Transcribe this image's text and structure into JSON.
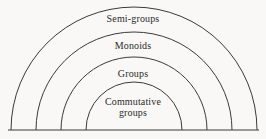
{
  "figure": {
    "background_color": "#f9f8f6",
    "line_color": "#3a3a3a",
    "text_color": "#2b2b2b",
    "width": 266,
    "height": 139
  },
  "diagram": {
    "center_x": 134,
    "baseline_y": 130,
    "baseline_x_start": 8,
    "baseline_x_end": 259,
    "bands": [
      {
        "index": 0,
        "label": "Semi-groups",
        "radius": 123,
        "left_foot_x": 11,
        "right_foot_x": 257,
        "apex_y": 8,
        "label_y": 19
      },
      {
        "index": 1,
        "label": "Monoids",
        "radius": 98,
        "left_foot_x": 36,
        "right_foot_x": 232,
        "apex_y": 33,
        "label_y": 46
      },
      {
        "index": 2,
        "label": "Groups",
        "radius": 73,
        "left_foot_x": 61,
        "right_foot_x": 207,
        "apex_y": 58,
        "label_y": 74
      },
      {
        "index": 3,
        "label": "Commutative\ngroups",
        "radius": 48,
        "left_foot_x": 86,
        "right_foot_x": 182,
        "apex_y": 83,
        "label_y": 102
      }
    ]
  }
}
